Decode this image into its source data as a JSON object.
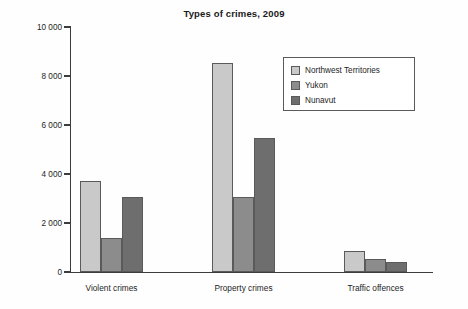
{
  "chart_data": {
    "type": "bar",
    "title": "Types of crimes, 2009",
    "xlabel": "",
    "ylabel": "",
    "categories": [
      "Violent crimes",
      "Property crimes",
      "Traffic offences"
    ],
    "series": [
      {
        "name": "Northwest Territories",
        "color": "#c9c9c9",
        "values": [
          3700,
          8550,
          850
        ]
      },
      {
        "name": "Yukon",
        "color": "#8c8c8c",
        "values": [
          1400,
          3050,
          530
        ]
      },
      {
        "name": "Nunavut",
        "color": "#6e6e6e",
        "values": [
          3050,
          5450,
          410
        ]
      }
    ],
    "ylim": [
      0,
      10000
    ],
    "ytick_values": [
      0,
      2000,
      4000,
      6000,
      8000,
      10000
    ],
    "ytick_labels": [
      "0",
      "2 000",
      "4 000",
      "6 000",
      "8 000",
      "10 000"
    ],
    "grid": false,
    "legend_position": "top-right"
  },
  "legend": {
    "entries": [
      {
        "label": "Northwest Territories",
        "color": "#c9c9c9"
      },
      {
        "label": "Yukon",
        "color": "#8c8c8c"
      },
      {
        "label": "Nunavut",
        "color": "#6e6e6e"
      }
    ]
  }
}
